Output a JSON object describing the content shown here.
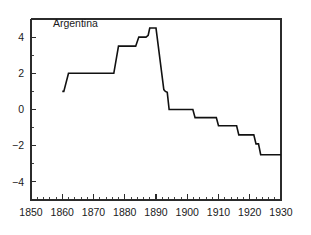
{
  "chart_data": {
    "type": "line",
    "title": "",
    "series_label": "Argentina",
    "xlabel": "",
    "ylabel": "",
    "xlim": [
      1850,
      1930
    ],
    "ylim": [
      -5.0,
      5.0
    ],
    "grid": false,
    "legend_position": "inside-top-left",
    "x_ticks": [
      1850,
      1860,
      1870,
      1880,
      1890,
      1900,
      1910,
      1920,
      1930
    ],
    "x_tick_labels": [
      "1850",
      "1860",
      "1870",
      "1880",
      "1890",
      "1900",
      "1910",
      "1920",
      "1930"
    ],
    "x_minor_tick_step": 2,
    "y_ticks": [
      4,
      2,
      0,
      -2,
      -4
    ],
    "y_tick_labels": [
      "4",
      "2",
      "0",
      "−2",
      "−4"
    ],
    "line_color": "#111111",
    "axis_color": "#2b2b2b",
    "series": [
      {
        "name": "Argentina",
        "step_style": "piecewise-linear",
        "x": [
          1860,
          1860.5,
          1862,
          1875,
          1876.5,
          1878,
          1882.5,
          1883.5,
          1884.5,
          1886,
          1886.8,
          1887.5,
          1888,
          1889.3,
          1890,
          1892.5,
          1893,
          1893.6,
          1894.2,
          1901,
          1901.8,
          1902.5,
          1908.5,
          1909.3,
          1910,
          1915,
          1915.8,
          1916.5,
          1920.5,
          1921.3,
          1922,
          1922.8,
          1923.5,
          1930
        ],
        "y": [
          1.0,
          1.0,
          2.0,
          2.0,
          2.0,
          3.5,
          3.5,
          3.5,
          4.0,
          4.0,
          4.0,
          4.1,
          4.5,
          4.5,
          4.5,
          1.1,
          1.0,
          0.95,
          0.0,
          0.0,
          0.0,
          -0.45,
          -0.45,
          -0.45,
          -0.9,
          -0.9,
          -0.9,
          -1.4,
          -1.4,
          -1.4,
          -1.9,
          -1.9,
          -2.5,
          -2.5
        ]
      }
    ],
    "annotations": [
      {
        "text": "Argentina",
        "x": 1857,
        "y": 4.55
      }
    ]
  }
}
